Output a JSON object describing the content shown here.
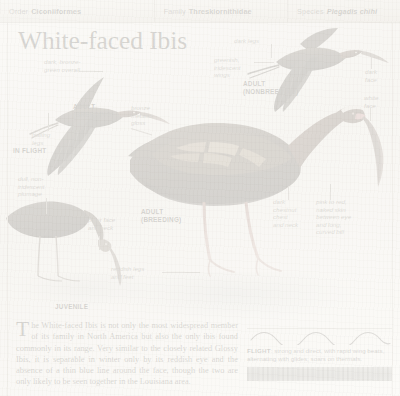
{
  "taxonomy": {
    "order": {
      "rank": "Order",
      "name": "Ciconiiformes"
    },
    "family": {
      "rank": "Family",
      "name": "Threskiornithidae"
    },
    "species": {
      "rank": "Species",
      "name": "Plegadis chihi"
    }
  },
  "title": "White-faced Ibis",
  "annotations": {
    "dark_bronze": "dark, bronze-\ngreen overall",
    "trailing_legs": "trailing\nlegs",
    "dull_plumage": "dull, non-\niridescent\nplumage",
    "paler_face": "paler face\nand neck",
    "bronze_gloss": "bronze\nmetallic\ngloss",
    "reddish_legs": "reddish legs\nand feet",
    "dark_legs": "dark legs",
    "greenish_wings": "greenish,\niridescent\nwings",
    "dark_face": "dark\nface",
    "white_face": "white\nface",
    "dark_chestnut": "dark\nchestnut\nchest\nand neck",
    "pink_to_red": "pink to red,\nnaked skin\nbetween eye\nand long,\ncurved bill"
  },
  "plate_labels": {
    "adult_breeding_flight": "ADULT\n(BREEDING)",
    "in_flight": "IN FLIGHT",
    "juvenile": "JUVENILE",
    "adult_breeding_main": "ADULT\n(BREEDING)",
    "adult_nonbreeding": "ADULT\n(NONBREEDING)"
  },
  "body": {
    "dropcap": "T",
    "paragraph": "he White-faced Ibis is not only the most widespread member of its family in North America but also the only ibis found commonly in its range. Very similar to the closely related Glossy Ibis, it is separable in winter only by its reddish eye and the absence of a thin blue line around the face, though the two are only likely to be seen together in the Louisiana area."
  },
  "flight": {
    "label": "FLIGHT",
    "description": ": strong and direct, with rapid wing beats, alternating with glides; soars on thermals."
  },
  "colors": {
    "header_bg": "#e9e6df",
    "rule": "#c9c5bc",
    "text": "#191712",
    "anno_text": "#4a4742",
    "bird_dark": "#221f1c",
    "bird_bronze": "#4a3b2a",
    "bill_pink": "#b9777a"
  }
}
